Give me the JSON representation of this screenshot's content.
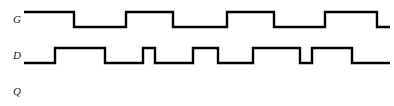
{
  "diagram": {
    "background_color": "#ffffff",
    "line_color": "#000000",
    "width": 394,
    "height": 106,
    "signals": [
      {
        "name": "G",
        "label": "G",
        "label_x": 13,
        "label_y": 14,
        "high_y": 12,
        "low_y": 27,
        "start_x": 24,
        "end_x": 390,
        "initial_level": "high",
        "transitions": [
          {
            "x": 74,
            "to": "low"
          },
          {
            "x": 126,
            "to": "high"
          },
          {
            "x": 173,
            "to": "low"
          },
          {
            "x": 227,
            "to": "high"
          },
          {
            "x": 274,
            "to": "low"
          },
          {
            "x": 325,
            "to": "high"
          },
          {
            "x": 377,
            "to": "low"
          }
        ]
      },
      {
        "name": "D",
        "label": "D",
        "label_x": 13,
        "label_y": 50,
        "high_y": 48,
        "low_y": 63,
        "start_x": 24,
        "end_x": 390,
        "initial_level": "low",
        "transitions": [
          {
            "x": 55,
            "to": "high"
          },
          {
            "x": 105,
            "to": "low"
          },
          {
            "x": 143,
            "to": "high"
          },
          {
            "x": 155,
            "to": "low"
          },
          {
            "x": 193,
            "to": "high"
          },
          {
            "x": 218,
            "to": "low"
          },
          {
            "x": 253,
            "to": "high"
          },
          {
            "x": 300,
            "to": "low"
          },
          {
            "x": 312,
            "to": "high"
          },
          {
            "x": 352,
            "to": "low"
          }
        ]
      },
      {
        "name": "Q",
        "label": "Q",
        "label_x": 13,
        "label_y": 86,
        "high_y": 84,
        "low_y": 99,
        "start_x": 24,
        "end_x": 390,
        "initial_level": "none",
        "transitions": []
      }
    ]
  }
}
